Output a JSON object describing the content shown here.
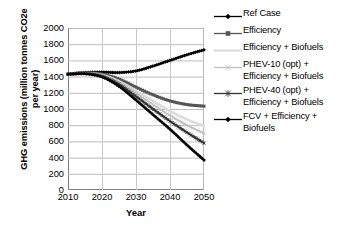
{
  "chart_data": {
    "type": "line",
    "title": "",
    "xlabel": "Year",
    "ylabel": "GHG emissions (million tonnes CO2e per year)",
    "ylabel_line1": "GHG emissions (million tonnes CO2e",
    "ylabel_line2": "per year)",
    "x": [
      2010,
      2015,
      2020,
      2025,
      2030,
      2035,
      2040,
      2045,
      2050
    ],
    "xlim": [
      2010,
      2050
    ],
    "ylim": [
      0,
      2000
    ],
    "xticks": [
      2010,
      2020,
      2030,
      2040,
      2050
    ],
    "yticks": [
      0,
      200,
      400,
      600,
      800,
      1000,
      1200,
      1400,
      1600,
      1800,
      2000
    ],
    "grid": true,
    "legend_position": "right",
    "series": [
      {
        "name": "Ref Case",
        "marker": "diamond",
        "color": "#000000",
        "values": [
          1430,
          1450,
          1455,
          1450,
          1470,
          1530,
          1600,
          1670,
          1730
        ]
      },
      {
        "name": "Efficiency",
        "marker": "square",
        "color": "#555555",
        "values": [
          1430,
          1445,
          1430,
          1370,
          1270,
          1175,
          1100,
          1055,
          1035
        ]
      },
      {
        "name": "Efficiency + Biofuels",
        "marker": "none",
        "color": "#dcdcdc",
        "values": [
          1430,
          1440,
          1420,
          1345,
          1225,
          1100,
          975,
          870,
          790
        ]
      },
      {
        "name": "PHEV-10 (opt) + Efficiency + Biofuels",
        "marker": "x",
        "color": "#c0c0c0",
        "values": [
          1430,
          1440,
          1415,
          1330,
          1195,
          1055,
          920,
          800,
          700
        ]
      },
      {
        "name": "PHEV-40 (opt) + Efficiency + Biofuels",
        "marker": "asterisk",
        "color": "#303030",
        "values": [
          1430,
          1438,
          1405,
          1305,
          1155,
          1000,
          850,
          710,
          580
        ]
      },
      {
        "name": "FCV + Efficiency + Biofuels",
        "marker": "diamond",
        "color": "#000000",
        "values": [
          1430,
          1435,
          1395,
          1280,
          1110,
          930,
          750,
          555,
          370
        ]
      }
    ]
  },
  "legend": {
    "entries": [
      {
        "label_line1": "Ref Case",
        "label_line2": ""
      },
      {
        "label_line1": "Efficiency",
        "label_line2": ""
      },
      {
        "label_line1": "Efficiency + Biofuels",
        "label_line2": ""
      },
      {
        "label_line1": "PHEV-10 (opt) +",
        "label_line2": "Efficiency + Biofuels"
      },
      {
        "label_line1": "PHEV-40 (opt) +",
        "label_line2": "Efficiency + Biofuels"
      },
      {
        "label_line1": "FCV + Efficiency +",
        "label_line2": "Biofuels"
      }
    ]
  }
}
